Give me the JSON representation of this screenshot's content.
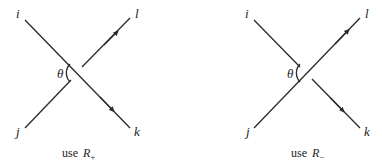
{
  "diagrams": [
    {
      "id": "left",
      "labels": {
        "top_left": "i",
        "top_right": "l",
        "bottom_left": "j",
        "bottom_right": "k",
        "angle": "θ"
      },
      "over_strand": "i-k",
      "caption": {
        "prefix": "use ",
        "symbol": "R",
        "subscript": "+"
      }
    },
    {
      "id": "right",
      "labels": {
        "top_left": "i",
        "top_right": "l",
        "bottom_left": "j",
        "bottom_right": "k",
        "angle": "θ"
      },
      "over_strand": "j-l",
      "caption": {
        "prefix": "use ",
        "symbol": "R",
        "subscript": "−"
      }
    }
  ]
}
